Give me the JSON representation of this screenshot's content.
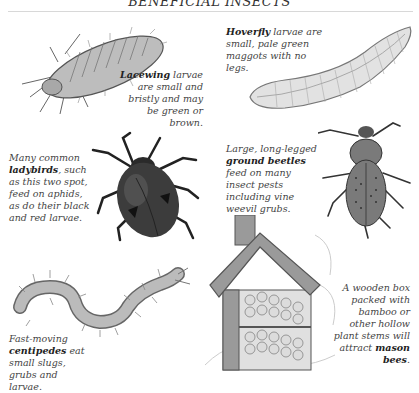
{
  "page": {
    "title": "BENEFICIAL INSECTS"
  },
  "captions": {
    "lacewing": {
      "bold": "Lacewing",
      "text": " larvae are small and bristly and may be green or brown."
    },
    "hoverfly": {
      "bold": "Hoverfly",
      "text": " larvae are small, pale green maggots with no legs."
    },
    "ladybird": {
      "pre": "Many common ",
      "bold": "ladybirds",
      "text": ", such as this two spot, feed on aphids, as do their black and red larvae."
    },
    "ground_beetle": {
      "pre": "Large, long-legged ",
      "bold": "ground beetles",
      "text": " feed on many insect pests including vine weevil grubs."
    },
    "centipede": {
      "pre": "Fast-moving ",
      "bold": "centipedes",
      "text": " eat small slugs, grubs and larvae."
    },
    "mason_bee": {
      "pre": "A wooden box packed with bamboo or other hollow plant stems will attract ",
      "bold": "mason bees",
      "text": "."
    }
  },
  "illustrations": [
    {
      "name": "lacewing-larva",
      "colors": {
        "fill": "#bdbdbd",
        "stroke": "#555555"
      }
    },
    {
      "name": "hoverfly-larva",
      "colors": {
        "fill": "#e2e2e2",
        "stroke": "#777777"
      }
    },
    {
      "name": "ladybird",
      "colors": {
        "fill": "#3c3c3c",
        "spot": "#111111"
      }
    },
    {
      "name": "ground-beetle",
      "colors": {
        "fill": "#7a7a7a",
        "stroke": "#333333"
      }
    },
    {
      "name": "centipede",
      "colors": {
        "fill": "#bbbbbb",
        "stroke": "#666666"
      }
    },
    {
      "name": "bee-house",
      "colors": {
        "wood": "#9a9a9a",
        "stems": "#dcdcdc"
      }
    }
  ]
}
